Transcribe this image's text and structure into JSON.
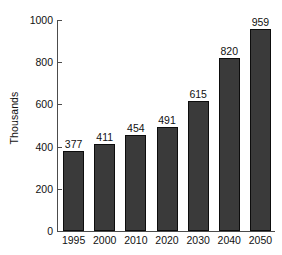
{
  "chart_data": {
    "type": "bar",
    "title": "",
    "subtitle": "",
    "xlabel": "",
    "ylabel": "Thousands",
    "categories": [
      "1995",
      "2000",
      "2010",
      "2020",
      "2030",
      "2040",
      "2050"
    ],
    "values": [
      377,
      411,
      454,
      491,
      615,
      820,
      959
    ],
    "data_labels": [
      "377",
      "411",
      "454",
      "491",
      "615",
      "820",
      "959"
    ],
    "series": [
      {
        "name": "",
        "values": [
          377,
          411,
          454,
          491,
          615,
          820,
          959
        ]
      }
    ],
    "ylim": [
      0,
      1000
    ],
    "y_ticks": [
      0,
      200,
      400,
      600,
      800,
      1000
    ],
    "y_tick_labels": [
      "0",
      "200",
      "400",
      "600",
      "800",
      "1000"
    ],
    "grid": false,
    "legend": false,
    "legend_position": "none",
    "bar_color": "#3a3a3a",
    "bar_edge_color": "#0d0d0d",
    "axis_color": "#4c4c4c",
    "background_color": "#ffffff",
    "text_color": "#111111"
  }
}
